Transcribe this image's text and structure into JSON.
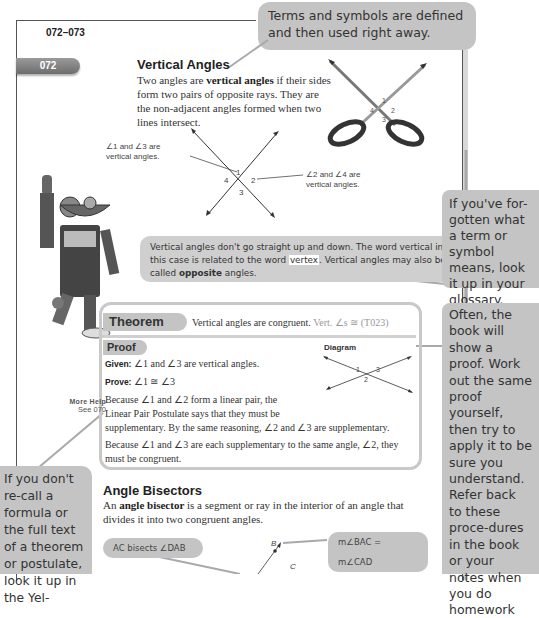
{
  "header": {
    "page_range": "072–073",
    "section_number": "072"
  },
  "vertical_angles": {
    "title": "Vertical Angles",
    "definition_pre": "Two angles are ",
    "definition_term": "vertical angles",
    "definition_post": " if their sides form two pairs of opposite rays. They are the non-adjacent angles formed when two lines intersect.",
    "diagram": {
      "labels": [
        "1",
        "2",
        "3",
        "4"
      ],
      "callout_left": "∠1 and ∠3 are vertical angles.",
      "callout_right": "∠2 and ∠4 are vertical angles."
    },
    "scissors_labels": [
      "1",
      "2",
      "3",
      "4"
    ]
  },
  "notes": {
    "top": "Terms and symbols are defined and then used right away.",
    "vertex_pre": "Vertical angles don't go straight up and down. The word vertical in this case is related to the word ",
    "vertex_word": "vertex",
    "vertex_mid": ". Vertical angles may also be called ",
    "vertex_bold": "opposite",
    "vertex_post": " angles.",
    "right_glossary": "If you've for-gotten what a term or symbol means, look it up in your glossary.",
    "right_proof": "Often, the book will show a proof. Work out the same proof yourself, then try to apply it to be sure you understand. Refer back to these proce-dures in the book or your notes when you do homework",
    "left_formula": "If you don't re-call a formula or the full text of a theorem or postulate, look it up in the Yel-"
  },
  "theorem": {
    "tab_label": "Theorem",
    "statement": "Vertical angles are congruent.",
    "reference": "Vert. ∠s ≅ (T023)"
  },
  "proof": {
    "tab_label": "Proof",
    "diagram_label": "Diagram",
    "diagram_numbers": [
      "1",
      "2",
      "3"
    ],
    "given_label": "Given:",
    "given_text": "∠1 and ∠3 are vertical angles.",
    "prove_label": "Prove:",
    "prove_text": "∠1 ≅ ∠3",
    "para1_line1": "Because ∠1 and ∠2 form a linear pair, the",
    "para1_line2": "Linear Pair Postulate says that they must be",
    "para1_line3": "supplementary. By the same reasoning, ∠2 and ∠3 are supplementary.",
    "para2": "Because ∠1 and ∠3 are each supplementary to the same angle, ∠2, they must be congruent."
  },
  "more_help": {
    "title": "More Help",
    "see": "See 070"
  },
  "angle_bisectors": {
    "title": "Angle Bisectors",
    "definition_pre": "An ",
    "definition_term": "angle bisector",
    "definition_post": " is a segment or ray in the interior of an angle that divides it into two congruent angles.",
    "callout_left": "AC bisects ∠DAB",
    "callout_right": "m∠BAC = m∠CAD",
    "point_b": "B",
    "point_c": "C"
  }
}
